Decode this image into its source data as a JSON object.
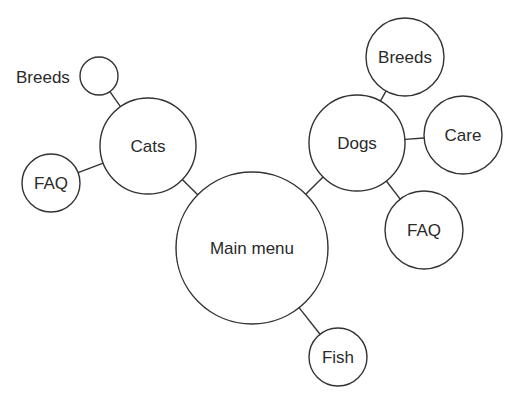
{
  "diagram": {
    "type": "site-map-bubble",
    "nodes": [
      {
        "id": "main",
        "label": "Main menu",
        "cx": 252,
        "cy": 248,
        "r": 76
      },
      {
        "id": "cats",
        "label": "Cats",
        "cx": 148,
        "cy": 146,
        "r": 48
      },
      {
        "id": "cats-breeds",
        "label": "",
        "cx": 99,
        "cy": 76,
        "r": 19
      },
      {
        "id": "cats-faq",
        "label": "FAQ",
        "cx": 51,
        "cy": 183,
        "r": 29
      },
      {
        "id": "dogs",
        "label": "Dogs",
        "cx": 357,
        "cy": 143,
        "r": 48
      },
      {
        "id": "dogs-breeds",
        "label": "Breeds",
        "cx": 405,
        "cy": 57,
        "r": 39
      },
      {
        "id": "dogs-care",
        "label": "Care",
        "cx": 463,
        "cy": 135,
        "r": 39
      },
      {
        "id": "dogs-faq",
        "label": "FAQ",
        "cx": 424,
        "cy": 230,
        "r": 39
      },
      {
        "id": "fish",
        "label": "Fish",
        "cx": 338,
        "cy": 357,
        "r": 29
      }
    ],
    "external_labels": [
      {
        "for": "cats-breeds",
        "label": "Breeds",
        "x": 16,
        "y": 83
      }
    ],
    "edges": [
      [
        "main",
        "cats"
      ],
      [
        "main",
        "dogs"
      ],
      [
        "main",
        "fish"
      ],
      [
        "cats",
        "cats-breeds"
      ],
      [
        "cats",
        "cats-faq"
      ],
      [
        "dogs",
        "dogs-breeds"
      ],
      [
        "dogs",
        "dogs-care"
      ],
      [
        "dogs",
        "dogs-faq"
      ]
    ],
    "colors": {
      "stroke": "#333333",
      "fill": "#ffffff",
      "text": "#2a2a2a"
    }
  }
}
